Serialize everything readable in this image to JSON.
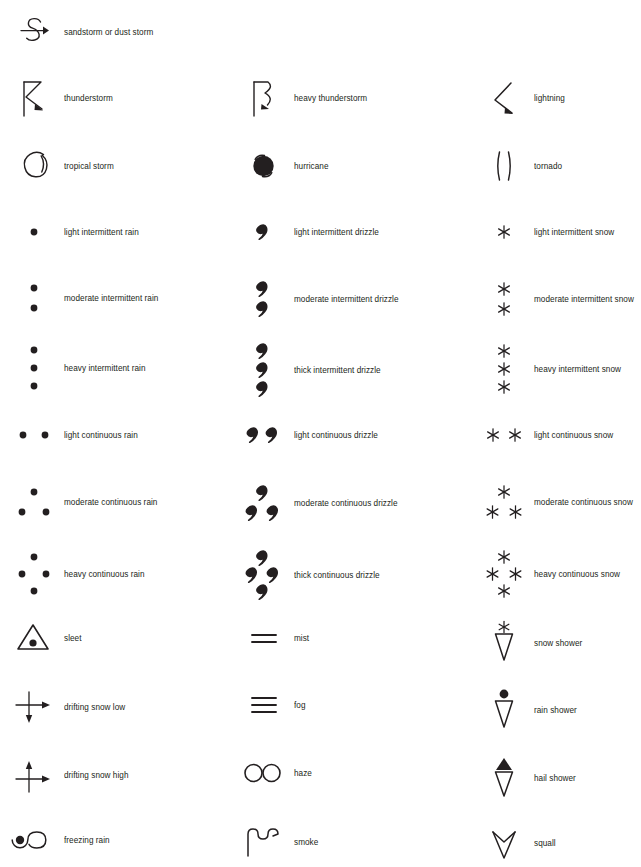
{
  "document": {
    "title": "Weather symbols legend",
    "type": "symbol-legend",
    "background_color": "#ffffff",
    "ink_color": "#231f20",
    "columns": 3,
    "width": 641,
    "height": 867
  },
  "entries": [
    {
      "id": "sandstorm",
      "label": "sandstorm or dust storm",
      "icon": "sandstorm-icon",
      "col": 1,
      "y": 12
    },
    {
      "id": "thunderstorm",
      "label": "thunderstorm",
      "icon": "thunderstorm-icon",
      "col": 1,
      "y": 76
    },
    {
      "id": "heavy-thunderstorm",
      "label": "heavy thunderstorm",
      "icon": "heavy-thunderstorm-icon",
      "col": 2,
      "y": 76
    },
    {
      "id": "lightning",
      "label": "lightning",
      "icon": "lightning-icon",
      "col": 3,
      "y": 76
    },
    {
      "id": "tropical-storm",
      "label": "tropical storm",
      "icon": "tropical-storm-icon",
      "col": 1,
      "y": 144
    },
    {
      "id": "hurricane",
      "label": "hurricane",
      "icon": "hurricane-icon",
      "col": 2,
      "y": 144
    },
    {
      "id": "tornado",
      "label": "tornado",
      "icon": "tornado-icon",
      "col": 3,
      "y": 144
    },
    {
      "id": "light-intermittent-rain",
      "label": "light intermittent rain",
      "icon": "rain-1-dot-icon",
      "col": 1,
      "y": 212
    },
    {
      "id": "light-intermittent-drizzle",
      "label": "light intermittent drizzle",
      "icon": "drizzle-1-comma-icon",
      "col": 2,
      "y": 212
    },
    {
      "id": "light-intermittent-snow",
      "label": "light intermittent snow",
      "icon": "snow-1-star-icon",
      "col": 3,
      "y": 212
    },
    {
      "id": "moderate-intermittent-rain",
      "label": "moderate intermittent rain",
      "icon": "rain-2-dot-vertical-icon",
      "col": 1,
      "y": 276
    },
    {
      "id": "moderate-intermittent-drizzle",
      "label": "moderate intermittent drizzle",
      "icon": "drizzle-2-comma-vertical-icon",
      "col": 2,
      "y": 276
    },
    {
      "id": "moderate-intermittent-snow",
      "label": "moderate intermittent snow",
      "icon": "snow-2-star-vertical-icon",
      "col": 3,
      "y": 276
    },
    {
      "id": "heavy-intermittent-rain",
      "label": "heavy intermittent rain",
      "icon": "rain-3-dot-vertical-icon",
      "col": 1,
      "y": 340
    },
    {
      "id": "thick-intermittent-drizzle",
      "label": "thick intermittent drizzle",
      "icon": "drizzle-3-comma-vertical-icon",
      "col": 2,
      "y": 340
    },
    {
      "id": "heavy-intermittent-snow",
      "label": "heavy intermittent snow",
      "icon": "snow-3-star-vertical-icon",
      "col": 3,
      "y": 340
    },
    {
      "id": "light-continuous-rain",
      "label": "light continuous rain",
      "icon": "rain-2-dot-horizontal-icon",
      "col": 1,
      "y": 415
    },
    {
      "id": "light-continuous-drizzle",
      "label": "light continuous drizzle",
      "icon": "drizzle-2-comma-horizontal-icon",
      "col": 2,
      "y": 415
    },
    {
      "id": "light-continuous-snow",
      "label": "light continuous snow",
      "icon": "snow-2-star-horizontal-icon",
      "col": 3,
      "y": 415
    },
    {
      "id": "moderate-continuous-rain",
      "label": "moderate continuous rain",
      "icon": "rain-3-dot-triangle-icon",
      "col": 1,
      "y": 478
    },
    {
      "id": "moderate-continuous-drizzle",
      "label": "moderate continuous drizzle",
      "icon": "drizzle-3-comma-triangle-icon",
      "col": 2,
      "y": 478
    },
    {
      "id": "moderate-continuous-snow",
      "label": "moderate continuous snow",
      "icon": "snow-3-star-triangle-icon",
      "col": 3,
      "y": 478
    },
    {
      "id": "heavy-continuous-rain",
      "label": "heavy continuous rain",
      "icon": "rain-4-dot-diamond-icon",
      "col": 1,
      "y": 546
    },
    {
      "id": "thick-continuous-drizzle",
      "label": "thick continuous drizzle",
      "icon": "drizzle-4-comma-diamond-icon",
      "col": 2,
      "y": 546
    },
    {
      "id": "heavy-continuous-snow",
      "label": "heavy continuous snow",
      "icon": "snow-4-star-diamond-icon",
      "col": 3,
      "y": 546
    },
    {
      "id": "sleet",
      "label": "sleet",
      "icon": "sleet-icon",
      "col": 1,
      "y": 618
    },
    {
      "id": "mist",
      "label": "mist",
      "icon": "mist-icon",
      "col": 2,
      "y": 618
    },
    {
      "id": "snow-shower",
      "label": "snow shower",
      "icon": "snow-shower-icon",
      "col": 3,
      "y": 618
    },
    {
      "id": "drifting-snow-low",
      "label": "drifting snow low",
      "icon": "drifting-snow-low-icon",
      "col": 1,
      "y": 685
    },
    {
      "id": "fog",
      "label": "fog",
      "icon": "fog-icon",
      "col": 2,
      "y": 685
    },
    {
      "id": "rain-shower",
      "label": "rain shower",
      "icon": "rain-shower-icon",
      "col": 3,
      "y": 685
    },
    {
      "id": "drifting-snow-high",
      "label": "drifting snow high",
      "icon": "drifting-snow-high-icon",
      "col": 1,
      "y": 753
    },
    {
      "id": "haze",
      "label": "haze",
      "icon": "haze-icon",
      "col": 2,
      "y": 753
    },
    {
      "id": "hail-shower",
      "label": "hail shower",
      "icon": "hail-shower-icon",
      "col": 3,
      "y": 753
    },
    {
      "id": "freezing-rain",
      "label": "freezing rain",
      "icon": "freezing-rain-icon",
      "col": 1,
      "y": 820
    },
    {
      "id": "smoke",
      "label": "smoke",
      "icon": "smoke-icon",
      "col": 2,
      "y": 820
    },
    {
      "id": "squall",
      "label": "squall",
      "icon": "squall-icon",
      "col": 3,
      "y": 820
    }
  ]
}
